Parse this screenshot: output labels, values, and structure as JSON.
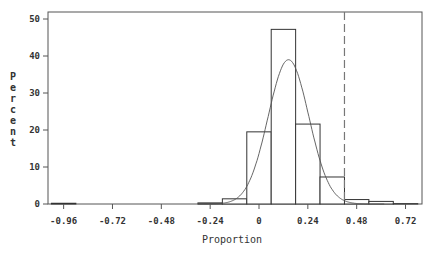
{
  "chart_data": {
    "type": "bar",
    "subtype": "histogram-with-normal-curve",
    "title": "",
    "xlabel": "Proportion",
    "ylabel": "Percent",
    "xlim": [
      -1.02,
      0.78
    ],
    "ylim": [
      0,
      52
    ],
    "grid": false,
    "legend": null,
    "bin_width": 0.12,
    "x_ticks": [
      -0.96,
      -0.72,
      -0.48,
      -0.24,
      0,
      0.24,
      0.48,
      0.72
    ],
    "x_tick_labels": [
      "-0.96",
      "-0.72",
      "-0.48",
      "-0.24",
      "0",
      "0.24",
      "0.48",
      "0.72"
    ],
    "y_ticks": [
      0,
      10,
      20,
      30,
      40,
      50
    ],
    "y_tick_labels": [
      "0",
      "10",
      "20",
      "30",
      "40",
      "50"
    ],
    "categories": [
      -0.96,
      -0.84,
      -0.72,
      -0.6,
      -0.48,
      -0.36,
      -0.24,
      -0.12,
      0,
      0.12,
      0.24,
      0.36,
      0.48,
      0.6,
      0.72
    ],
    "values": [
      0.2,
      0,
      0,
      0,
      0,
      0,
      0.3,
      1.4,
      19.5,
      47.2,
      21.6,
      7.3,
      1.2,
      0.7,
      0.1
    ],
    "normal_curve": {
      "mean": 0.145,
      "std": 0.1,
      "peak_percent": 39
    },
    "reference_line": {
      "x": 0.42,
      "style": "dashed"
    },
    "colors": {
      "bar_edge": "#333333",
      "bar_fill": "#ffffff",
      "curve": "#555555",
      "axis": "#555555",
      "reference_line": "#777777"
    }
  }
}
